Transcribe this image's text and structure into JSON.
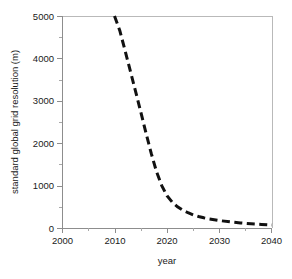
{
  "chart_data": {
    "type": "line",
    "title": "",
    "xlabel": "year",
    "ylabel": "standard global grid resolution  (m)",
    "xlim": [
      2000,
      2040
    ],
    "ylim": [
      0,
      5000
    ],
    "grid": false,
    "legend": null,
    "x_ticks": [
      2000,
      2010,
      2020,
      2030,
      2040
    ],
    "x_tick_labels": [
      "2000",
      "2010",
      "2020",
      "2030",
      "2040"
    ],
    "x_minor_ticks": [
      2005,
      2015,
      2025,
      2035
    ],
    "y_ticks": [
      0,
      1000,
      2000,
      3000,
      4000,
      5000
    ],
    "y_tick_labels": [
      "0",
      "1000",
      "2000",
      "3000",
      "4000",
      "5000"
    ],
    "y_minor_ticks": [
      500,
      1500,
      2500,
      3500,
      4500
    ],
    "series": [
      {
        "name": "standard global grid resolution",
        "style": "dashed",
        "color": "#111111",
        "x": [
          2010.0,
          2011.0,
          2012.0,
          2013.0,
          2014.0,
          2015.0,
          2016.0,
          2017.0,
          2018.0,
          2019.0,
          2020.0,
          2021.0,
          2022.0,
          2023.0,
          2024.0,
          2025.0,
          2026.0,
          2027.0,
          2028.0,
          2029.0,
          2030.0,
          2032.0,
          2034.0,
          2036.0,
          2038.0,
          2040.0
        ],
        "values": [
          5000,
          4660,
          4190,
          3710,
          3230,
          2740,
          2240,
          1760,
          1330,
          1000,
          760,
          610,
          500,
          420,
          360,
          310,
          270,
          240,
          215,
          195,
          175,
          145,
          120,
          100,
          85,
          70
        ]
      }
    ],
    "axis_colors": {
      "frame": "#b9b9b9",
      "axis": "#8d8d8d",
      "text": "#1a1a1a",
      "curve": "#111111",
      "plot_background": "#ffffff"
    }
  }
}
